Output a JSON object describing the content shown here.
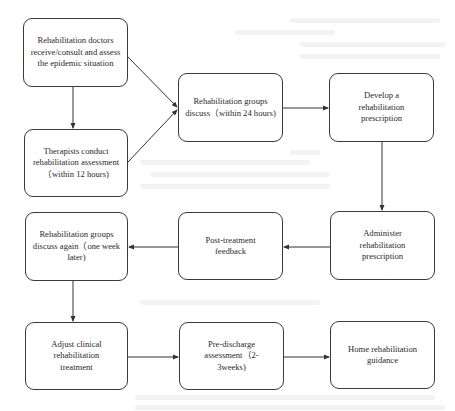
{
  "diagram": {
    "type": "flowchart",
    "nodes": [
      {
        "id": "n1",
        "label": "Rehabilitation doctors receive/consult and assess the epidemic situation"
      },
      {
        "id": "n2",
        "label": "Therapists conduct rehabilitation assessment（within 12 hours)"
      },
      {
        "id": "n3",
        "label": "Rehabilitation groups discuss（within 24 hours)"
      },
      {
        "id": "n4",
        "label": "Develop a rehabilitation prescription"
      },
      {
        "id": "n5",
        "label": "Administer rehabilitation prescription"
      },
      {
        "id": "n6",
        "label": "Post-treatment feedback"
      },
      {
        "id": "n7",
        "label": "Rehabilitation groups discuss again（one week later)"
      },
      {
        "id": "n8",
        "label": "Adjust clinical rehabilitation treatment"
      },
      {
        "id": "n9",
        "label": "Pre-discharge assessment（2-3weeks)"
      },
      {
        "id": "n10",
        "label": "Home rehabilitation guidance"
      }
    ],
    "edges": [
      {
        "from": "n1",
        "to": "n2"
      },
      {
        "from": "n1",
        "to": "n3"
      },
      {
        "from": "n2",
        "to": "n3"
      },
      {
        "from": "n3",
        "to": "n4"
      },
      {
        "from": "n4",
        "to": "n5"
      },
      {
        "from": "n5",
        "to": "n6"
      },
      {
        "from": "n6",
        "to": "n7"
      },
      {
        "from": "n7",
        "to": "n8"
      },
      {
        "from": "n8",
        "to": "n9"
      },
      {
        "from": "n9",
        "to": "n10"
      }
    ],
    "colors": {
      "border": "#3a3a3a",
      "text": "#2a2a2a",
      "arrow": "#333333",
      "background": "#ffffff"
    }
  }
}
